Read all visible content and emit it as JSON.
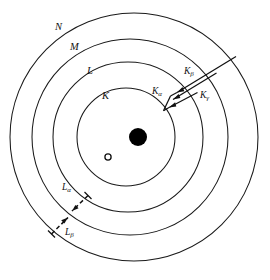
{
  "figure": {
    "background_color": "#ffffff",
    "stroke_color": "#111111",
    "nucleus_color": "#000000",
    "width": 270,
    "height": 280
  },
  "shells": [
    {
      "id": "K",
      "label": "K",
      "label_x": 102,
      "label_y": 99,
      "cx": 126,
      "cy": 137,
      "r": 49
    },
    {
      "id": "L",
      "label": "L",
      "label_x": 87,
      "label_y": 74,
      "cx": 128,
      "cy": 137,
      "r": 75
    },
    {
      "id": "M",
      "label": "M",
      "label_x": 70,
      "label_y": 50,
      "cx": 130,
      "cy": 137,
      "r": 98
    },
    {
      "id": "N",
      "label": "N",
      "label_x": 55,
      "label_y": 30,
      "cx": 134,
      "cy": 137,
      "r": 124
    }
  ],
  "nucleus": {
    "label": "nucleus",
    "cx": 138,
    "cy": 137,
    "r": 9
  },
  "vacancy": {
    "label": "electron vacancy",
    "cx": 108,
    "cy": 157,
    "r": 3.1
  },
  "transitions": [
    {
      "id": "k-alpha",
      "label": "K",
      "subscript": "α",
      "series": "K",
      "style": "solid",
      "from_shell": "L",
      "to_shell": "K",
      "label_x": 154,
      "label_y": 94,
      "x1": 197,
      "y1": 92,
      "x2": 168,
      "y2": 108
    },
    {
      "id": "k-beta",
      "label": "K",
      "subscript": "β",
      "series": "K",
      "style": "solid",
      "from_shell": "M",
      "to_shell": "K",
      "label_x": 186,
      "label_y": 74,
      "x1": 216,
      "y1": 73,
      "x2": 172,
      "y2": 100
    },
    {
      "id": "k-gamma",
      "label": "K",
      "subscript": "γ",
      "series": "K",
      "style": "solid",
      "from_shell": "N",
      "to_shell": "K",
      "label_x": 202,
      "label_y": 98,
      "x1": 236,
      "y1": 57,
      "x2": 176,
      "y2": 93
    },
    {
      "id": "l-alpha",
      "label": "L",
      "subscript": "α",
      "series": "L",
      "style": "dashed",
      "from_shell": "M",
      "to_shell": "L",
      "label_x": 63,
      "label_y": 190,
      "x1": 88,
      "y1": 196,
      "x2": 71,
      "y2": 212
    },
    {
      "id": "l-beta",
      "label": "L",
      "subscript": "β",
      "series": "L",
      "style": "dashed",
      "from_shell": "N",
      "to_shell": "L",
      "label_x": 66,
      "label_y": 234,
      "x1": 52,
      "y1": 234,
      "x2": 68,
      "y2": 217
    }
  ]
}
